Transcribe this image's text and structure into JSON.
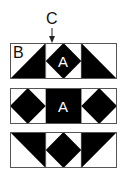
{
  "labels": {
    "c": "C",
    "b": "B",
    "a": "A"
  },
  "colors": {
    "fill": "#000000",
    "background": "#ffffff",
    "border": "#555555"
  },
  "panels": [
    {
      "id": "row-1",
      "blocks": [
        "half-square-triangle-lower-right",
        "square-in-square-with-A",
        "half-square-triangle-lower-left"
      ],
      "annotations": [
        "B",
        "A",
        "C"
      ]
    },
    {
      "id": "row-2",
      "blocks": [
        "square-in-square",
        "solid-with-A",
        "square-in-square"
      ],
      "annotations": [
        "A"
      ]
    },
    {
      "id": "row-3",
      "blocks": [
        "half-square-triangle-upper-right",
        "square-in-square",
        "half-square-triangle-upper-left"
      ],
      "annotations": []
    }
  ]
}
